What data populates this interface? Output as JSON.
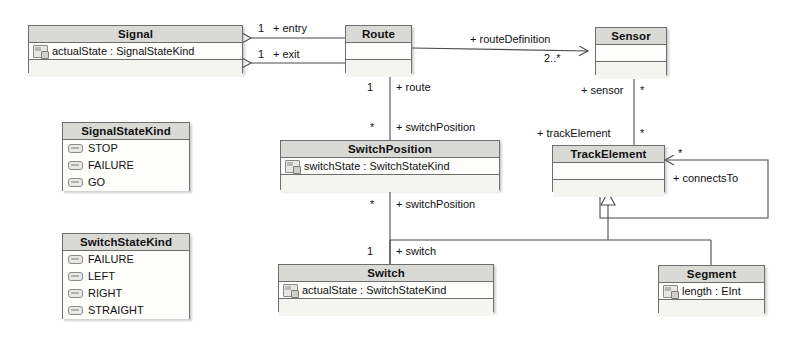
{
  "diagram": {
    "kind": "uml-class-diagram",
    "title": "",
    "colors": {
      "header_fill": "#d9d9d6",
      "body_fill": "#fbfbfa",
      "border": "#6e6e6e",
      "line": "#4a4a4a",
      "text": "#111111"
    }
  },
  "classes": [
    {
      "id": "signal",
      "name": "Signal",
      "attributes": [
        {
          "icon": "property-icon",
          "text": "actualState : SignalStateKind"
        }
      ],
      "operations": []
    },
    {
      "id": "route",
      "name": "Route",
      "attributes": [],
      "operations": []
    },
    {
      "id": "sensor",
      "name": "Sensor",
      "attributes": [],
      "operations": []
    },
    {
      "id": "switchposition",
      "name": "SwitchPosition",
      "attributes": [
        {
          "icon": "property-icon",
          "text": "switchState : SwitchStateKind"
        }
      ],
      "operations": []
    },
    {
      "id": "trackelement",
      "name": "TrackElement",
      "attributes": [],
      "operations": []
    },
    {
      "id": "switch",
      "name": "Switch",
      "attributes": [
        {
          "icon": "property-icon",
          "text": "actualState : SwitchStateKind"
        }
      ],
      "operations": []
    },
    {
      "id": "segment",
      "name": "Segment",
      "attributes": [
        {
          "icon": "property-icon",
          "text": "length : EInt"
        }
      ],
      "operations": []
    }
  ],
  "enumerations": [
    {
      "id": "signalstatekind",
      "name": "SignalStateKind",
      "literals": [
        "STOP",
        "FAILURE",
        "GO"
      ]
    },
    {
      "id": "switchstatekind",
      "name": "SwitchStateKind",
      "literals": [
        "FAILURE",
        "LEFT",
        "RIGHT",
        "STRAIGHT"
      ]
    }
  ],
  "associations": [
    {
      "id": "route-entry",
      "source": "route",
      "target": "signal",
      "role": "+ entry",
      "multiplicity": "1"
    },
    {
      "id": "route-exit",
      "source": "route",
      "target": "signal",
      "role": "+ exit",
      "multiplicity": "1"
    },
    {
      "id": "route-routedefinition",
      "source": "route",
      "target": "sensor",
      "role": "+ routeDefinition",
      "multiplicity": "2..*"
    },
    {
      "id": "switchposition-route",
      "source": "switchposition",
      "target": "route",
      "role": "+ route",
      "multiplicity": "1"
    },
    {
      "id": "route-switchposition",
      "source": "route",
      "target": "switchposition",
      "role": "+ switchPosition",
      "multiplicity": "*"
    },
    {
      "id": "switch-switchposition",
      "source": "switch",
      "target": "switchposition",
      "role": "+ switchPosition",
      "multiplicity": "*"
    },
    {
      "id": "switchposition-switch",
      "source": "switchposition",
      "target": "switch",
      "role": "+ switch",
      "multiplicity": "1"
    },
    {
      "id": "trackelement-sensor",
      "source": "trackelement",
      "target": "sensor",
      "role": "+ sensor",
      "multiplicity": "*"
    },
    {
      "id": "sensor-trackelement",
      "source": "sensor",
      "target": "trackelement",
      "role": "+ trackElement",
      "multiplicity": "*"
    },
    {
      "id": "trackelement-connectsto",
      "source": "trackelement",
      "target": "trackelement",
      "role": "+ connectsTo",
      "multiplicity": "*"
    }
  ],
  "generalizations": [
    {
      "id": "switch-isa-trackelement",
      "subclass": "switch",
      "superclass": "trackelement"
    },
    {
      "id": "segment-isa-trackelement",
      "subclass": "segment",
      "superclass": "trackelement"
    }
  ]
}
